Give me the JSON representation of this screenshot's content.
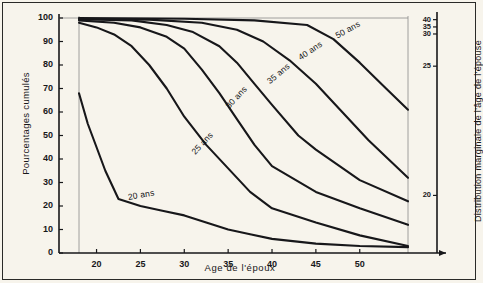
{
  "figure": {
    "background_color": "#f7f4ec",
    "ink_color": "#17171a",
    "guide_color": "#8c8c8c"
  },
  "chart_data": {
    "type": "line",
    "title": "",
    "xlabel": "Age de l'époux",
    "ylabel": "Pourcentages cumulés",
    "ylabel_right": "Distribution marginale de l'âge de l'épouse",
    "xlim": [
      15,
      56
    ],
    "ylim": [
      0,
      100
    ],
    "xticks": [
      20,
      25,
      30,
      35,
      40,
      45,
      50
    ],
    "xtick_labels": [
      "20",
      "25",
      "30",
      "35",
      "40",
      "45",
      "50"
    ],
    "yticks": [
      0,
      10,
      20,
      30,
      40,
      50,
      60,
      70,
      80,
      90,
      100
    ],
    "ytick_labels": [
      "0",
      "10",
      "20",
      "30",
      "40",
      "50",
      "60",
      "70",
      "80",
      "90",
      "100"
    ],
    "right_axis": {
      "label": "Distribution marginale de l'âge de l'épouse",
      "ticks": [
        40,
        35,
        30,
        25,
        20
      ],
      "tick_labels": [
        "40",
        "35",
        "30",
        "25",
        "20"
      ],
      "tick_positions_pct": [
        99.3,
        96.2,
        93.2,
        79.5,
        24.5
      ]
    },
    "grid": false,
    "legend": "inline-curve-labels",
    "guides": {
      "left_vertical_x": 18,
      "right_vertical_x": 55.5
    },
    "series": [
      {
        "name": "20 ans",
        "label": "20 ans",
        "x": [
          18,
          19,
          20,
          21,
          22.5,
          25,
          27.5,
          30,
          32.5,
          35,
          37.5,
          40,
          45,
          50,
          55.5
        ],
        "y": [
          68,
          55,
          45,
          35,
          23,
          20,
          18,
          16,
          13,
          10,
          8,
          6,
          4,
          3,
          2.5
        ]
      },
      {
        "name": "25 ans",
        "label": "25 ans",
        "x": [
          18,
          20,
          22,
          24,
          26,
          28,
          30,
          32.5,
          35,
          37.5,
          40,
          45,
          50,
          55.5
        ],
        "y": [
          98,
          96,
          93,
          88,
          80,
          70,
          58,
          46,
          36,
          26,
          19,
          13,
          7.5,
          3
        ]
      },
      {
        "name": "30 ans",
        "label": "30 ans",
        "x": [
          18,
          22,
          25,
          28,
          30,
          32,
          34,
          36,
          38,
          40,
          45,
          50,
          55.5
        ],
        "y": [
          99,
          98,
          96,
          92,
          87,
          78,
          68,
          57,
          46,
          37,
          26,
          19,
          12
        ]
      },
      {
        "name": "35 ans",
        "label": "35 ans",
        "x": [
          18,
          24,
          28,
          31,
          34,
          36,
          38,
          40,
          43,
          45,
          50,
          55.5
        ],
        "y": [
          99.5,
          99,
          97,
          94,
          88,
          81,
          72,
          63,
          50,
          44,
          31,
          22
        ]
      },
      {
        "name": "40 ans",
        "label": "40 ans",
        "x": [
          18,
          26,
          32,
          36,
          39,
          42,
          45,
          48,
          51,
          55.5
        ],
        "y": [
          99.7,
          99.3,
          98,
          95,
          90,
          82,
          72,
          60,
          48,
          32
        ]
      },
      {
        "name": "50 ans",
        "label": "50 ans",
        "x": [
          18,
          30,
          38,
          44,
          47,
          50,
          53,
          55.5
        ],
        "y": [
          100,
          99.7,
          99,
          97,
          91,
          81,
          70,
          61
        ]
      }
    ],
    "curve_label_placements": [
      {
        "name": "20 ans",
        "x_px": 128,
        "y_px": 192,
        "rotation_deg": -10
      },
      {
        "name": "25 ans",
        "x_px": 193,
        "y_px": 148,
        "rotation_deg": -47
      },
      {
        "name": "30 ans",
        "x_px": 227,
        "y_px": 102,
        "rotation_deg": -47
      },
      {
        "name": "35 ans",
        "x_px": 268,
        "y_px": 77,
        "rotation_deg": -40
      },
      {
        "name": "40 ans",
        "x_px": 299,
        "y_px": 53,
        "rotation_deg": -34
      },
      {
        "name": "50 ans",
        "x_px": 336,
        "y_px": 31,
        "rotation_deg": -29
      }
    ]
  }
}
